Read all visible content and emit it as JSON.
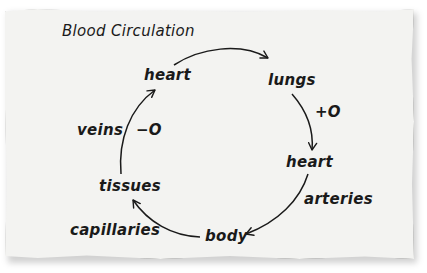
{
  "diagram": {
    "title": "Blood Circulation",
    "nodes": [
      {
        "id": "heart_top",
        "label": "heart"
      },
      {
        "id": "lungs",
        "label": "lungs"
      },
      {
        "id": "heart_right",
        "label": "heart"
      },
      {
        "id": "body",
        "label": "body"
      },
      {
        "id": "tissues",
        "label": "tissues"
      }
    ],
    "edges": [
      {
        "from": "heart_top",
        "to": "lungs",
        "label": ""
      },
      {
        "from": "lungs",
        "to": "heart_right",
        "label": "+O"
      },
      {
        "from": "heart_right",
        "to": "body",
        "label": "arteries"
      },
      {
        "from": "body",
        "to": "tissues",
        "label": "capillaries"
      },
      {
        "from": "tissues",
        "to": "heart_top",
        "label": "veins",
        "annotation": "−O"
      }
    ],
    "annotations": {
      "plus_oxygen": "+O",
      "minus_oxygen": "−O"
    },
    "colors": {
      "paper": "#f3f3f1",
      "ink": "#1a1a1a",
      "background": "#ffffff"
    }
  }
}
